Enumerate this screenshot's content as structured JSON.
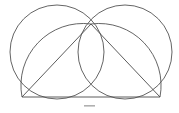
{
  "figure": {
    "width": 179,
    "height": 113,
    "background_color": "#ffffff",
    "stroke_color": "#545454",
    "line_color": "#4a4a4a",
    "dash_color": "#b0b0b0",
    "points": {
      "left_vertex": {
        "label": "A",
        "x": 22,
        "y": 97
      },
      "right_vertex": {
        "label": "B",
        "x": 160,
        "y": 97
      },
      "apex": {
        "label": "C",
        "x": 91,
        "y": 24
      },
      "left_circle_center": {
        "label": "O1",
        "x": 57,
        "y": 52
      },
      "right_circle_center": {
        "label": "O2",
        "x": 125,
        "y": 52
      },
      "left_circle_radius": 47,
      "right_circle_radius": 47,
      "left_extent_x": 8,
      "right_extent_x": 175,
      "top_extent_y": 8,
      "baseline_y": 97
    },
    "shapes": [
      {
        "name": "left-circle",
        "type": "circle",
        "cx": 57,
        "cy": 52,
        "r": 47
      },
      {
        "name": "right-circle",
        "type": "circle",
        "cx": 125,
        "cy": 52,
        "r": 47
      },
      {
        "name": "left-inner-arc",
        "type": "arc",
        "from": "left_vertex",
        "to": "apex"
      },
      {
        "name": "right-inner-arc",
        "type": "arc",
        "from": "apex",
        "to": "right_vertex"
      },
      {
        "name": "left-triangle-side",
        "type": "line",
        "from": "left_vertex",
        "to": "apex"
      },
      {
        "name": "right-triangle-side",
        "type": "line",
        "from": "apex",
        "to": "right_vertex"
      },
      {
        "name": "baseline",
        "type": "line",
        "from": "left_vertex",
        "to": "right_vertex"
      }
    ],
    "caption_dash": {
      "x": 84,
      "y": 105,
      "width": 11,
      "height": 1.6
    }
  }
}
